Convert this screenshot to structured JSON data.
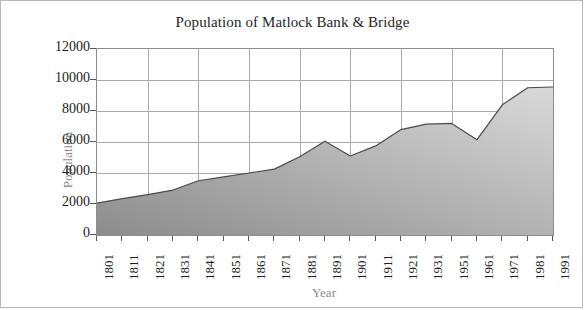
{
  "chart_data": {
    "type": "area",
    "title": "Population of Matlock Bank & Bridge",
    "xlabel": "Year",
    "ylabel": "Population",
    "categories": [
      "1801",
      "1811",
      "1821",
      "1831",
      "1841",
      "1851",
      "1861",
      "1871",
      "1881",
      "1891",
      "1901",
      "1911",
      "1921",
      "1931",
      "1951",
      "1961",
      "1971",
      "1981",
      "1991"
    ],
    "values": [
      2050,
      2350,
      2600,
      2900,
      3500,
      3750,
      4000,
      4250,
      5050,
      6050,
      5100,
      5750,
      6800,
      7150,
      7200,
      6150,
      8400,
      9500,
      9550
    ],
    "ylim": [
      0,
      12000
    ],
    "yticks": [
      0,
      2000,
      4000,
      6000,
      8000,
      10000,
      12000
    ],
    "ytick_labels": [
      "0",
      "2000",
      "4000",
      "6000",
      "8000",
      "10000",
      "12000"
    ],
    "grid": true,
    "grid_x_every": 2,
    "legend": "none",
    "colors": {
      "area_fill_dark": "#8c8c8c",
      "area_fill_light": "#d9d9d9",
      "line": "#4a4a4a",
      "grid": "#a9a9a9",
      "axis": "#8d8d8d",
      "title_text": "#262626",
      "tick_text": "#1d1d1d",
      "axis_title_text": "#8a8a8a",
      "figure_border": "#b9b9b9",
      "background": "#ffffff"
    }
  }
}
